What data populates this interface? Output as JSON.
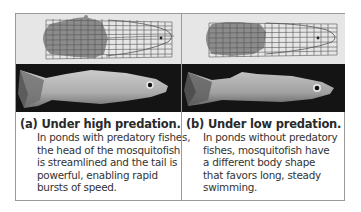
{
  "figure": {
    "panels": [
      {
        "id": "a",
        "label": "(a) Under high predation.",
        "body_lines": [
          "In ponds with predatory fishes,",
          "the head of the mosquitofish",
          "is streamlined and the tail is",
          "powerful, enabling rapid",
          "bursts of speed."
        ],
        "grid_diagram": "body-shape-grid-high-predation",
        "photo": "mosquitofish-high-predation-photo"
      },
      {
        "id": "b",
        "label": "(b) Under low predation.",
        "body_lines": [
          "In ponds without predatory",
          "fishes, mosquitofish have",
          "a different body shape",
          "that favors long, steady",
          "swimming."
        ],
        "grid_diagram": "body-shape-grid-low-predation",
        "photo": "mosquitofish-low-predation-photo"
      }
    ],
    "colors": {
      "grid_strip_bg": "#e6e6e6",
      "tail_shade": "#8c8c8c",
      "grid_line": "#555555",
      "photo_bg": "#141414",
      "border": "#9a9a9a"
    }
  }
}
